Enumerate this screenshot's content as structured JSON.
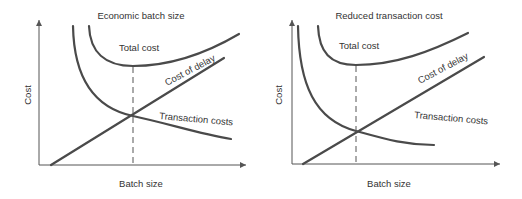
{
  "panels": [
    {
      "title": "Economic batch size",
      "y_axis_label": "Cost",
      "x_axis_label": "Batch size",
      "curves": {
        "total_cost": "Total cost",
        "cost_of_delay": "Cost of delay",
        "transaction_costs": "Transaction costs"
      }
    },
    {
      "title": "Reduced transaction cost",
      "y_axis_label": "Cost",
      "x_axis_label": "Batch size",
      "curves": {
        "total_cost": "Total cost",
        "cost_of_delay": "Cost of delay",
        "transaction_costs": "Transaction costs"
      }
    }
  ],
  "colors": {
    "curve": "#4a4a4a",
    "axis": "#555555",
    "text": "#333333"
  }
}
